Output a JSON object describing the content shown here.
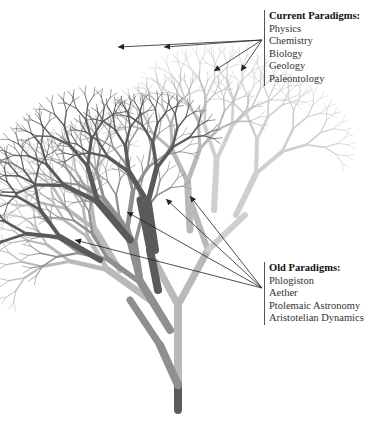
{
  "current_paradigms": {
    "title": "Current Paradigms:",
    "items": [
      "Physics",
      "Chemistry",
      "Biology",
      "Geology",
      "Paleontology"
    ],
    "arrow_origin": [
      262,
      40
    ],
    "arrow_targets": [
      [
        118,
        47
      ],
      [
        164,
        47
      ],
      [
        214,
        71
      ],
      [
        241,
        71
      ]
    ]
  },
  "old_paradigms": {
    "title": "Old Paradigms:",
    "items": [
      "Phlogiston",
      "Aether",
      "Ptolemaic Astronomy",
      "Aristotelian Dynamics"
    ],
    "arrow_origin": [
      262,
      288
    ],
    "arrow_targets": [
      [
        75,
        240
      ],
      [
        127,
        212
      ],
      [
        166,
        199
      ],
      [
        190,
        196
      ]
    ]
  },
  "colors": {
    "dark_branch": "#5a5a5a",
    "mid_branch": "#8f8f8f",
    "light_branch": "#b9b9b9",
    "lightest_branch": "#cfcfcf",
    "arrow": "#222222",
    "trunk_base": "#5c5c5c"
  }
}
